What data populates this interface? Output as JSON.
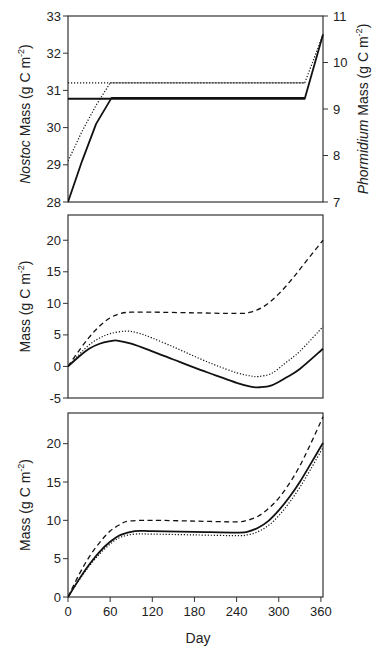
{
  "chart_data": [
    {
      "type": "line",
      "panel": "top",
      "title": "",
      "xlabel": "",
      "ylabel": "Nostoc Mass (g C m-2)",
      "ylabel_parts": {
        "italic": "Nostoc",
        "rest": " Mass (g C m",
        "sup": "-2",
        "close": ")"
      },
      "ylabel_right": "Phormidium Mass (g C m-2)",
      "ylabel_right_parts": {
        "italic": "Phormidium",
        "rest": " Mass (g C m",
        "sup": "-2",
        "close": ")"
      },
      "xlim": [
        0,
        363
      ],
      "ylim": [
        28,
        33
      ],
      "ylim_right": [
        7,
        11
      ],
      "yticks": [
        28,
        29,
        30,
        31,
        32,
        33
      ],
      "yticks_right": [
        7,
        8,
        9,
        10,
        11
      ],
      "grid": false,
      "series": [
        {
          "name": "Nostoc (solid)",
          "axis": "left",
          "style": "solid",
          "x": [
            0,
            20,
            40,
            62,
            337
          ],
          "y": [
            28.0,
            29.1,
            30.1,
            30.8,
            30.8
          ]
        },
        {
          "name": "Nostoc (dotted)",
          "axis": "left",
          "style": "dotted",
          "x": [
            0,
            20,
            40,
            60,
            337
          ],
          "y": [
            29.1,
            29.9,
            30.6,
            31.2,
            31.2
          ]
        },
        {
          "name": "Phormidium (solid)",
          "axis": "right",
          "style": "solid",
          "x": [
            0,
            337,
            363
          ],
          "y": [
            9.22,
            9.22,
            10.6
          ]
        },
        {
          "name": "Phormidium (dotted)",
          "axis": "right",
          "style": "dotted",
          "x": [
            0,
            337,
            363
          ],
          "y": [
            9.56,
            9.56,
            10.6
          ]
        }
      ]
    },
    {
      "type": "line",
      "panel": "middle",
      "title": "",
      "xlabel": "",
      "ylabel": "Mass (g C m-2)",
      "ylabel_parts": {
        "italic": "",
        "rest": "Mass (g C m",
        "sup": "-2",
        "close": ")"
      },
      "xlim": [
        0,
        363
      ],
      "ylim": [
        -5,
        24
      ],
      "yticks": [
        -5,
        0,
        5,
        10,
        15,
        20
      ],
      "grid": false,
      "series": [
        {
          "name": "solid",
          "style": "solid",
          "x": [
            0,
            15,
            30,
            45,
            60,
            70,
            90,
            120,
            150,
            180,
            210,
            240,
            260,
            273,
            290,
            310,
            330,
            363
          ],
          "y": [
            0,
            1.5,
            2.8,
            3.6,
            4.0,
            4.1,
            3.6,
            2.4,
            1.1,
            -0.2,
            -1.4,
            -2.6,
            -3.2,
            -3.3,
            -3.0,
            -1.8,
            -0.4,
            2.8
          ]
        },
        {
          "name": "dotted",
          "style": "dotted",
          "x": [
            0,
            15,
            30,
            45,
            60,
            82,
            100,
            120,
            150,
            180,
            210,
            240,
            260,
            271,
            290,
            310,
            330,
            363
          ],
          "y": [
            0,
            1.8,
            3.4,
            4.5,
            5.2,
            5.6,
            5.3,
            4.5,
            3.1,
            1.6,
            0.2,
            -1.0,
            -1.5,
            -1.6,
            -1.1,
            0.6,
            2.4,
            6.3
          ]
        },
        {
          "name": "dashed",
          "style": "dashed",
          "x": [
            0,
            15,
            30,
            45,
            60,
            75,
            90,
            120,
            180,
            240,
            260,
            280,
            300,
            320,
            340,
            363
          ],
          "y": [
            0,
            2.4,
            4.6,
            6.4,
            7.7,
            8.4,
            8.6,
            8.6,
            8.5,
            8.4,
            8.6,
            9.6,
            11.5,
            14.0,
            16.8,
            20.0
          ]
        }
      ]
    },
    {
      "type": "line",
      "panel": "bottom",
      "title": "",
      "xlabel": "Day",
      "ylabel": "Mass (g C m-2)",
      "ylabel_parts": {
        "italic": "",
        "rest": "Mass (g C m",
        "sup": "-2",
        "close": ")"
      },
      "xlim": [
        0,
        363
      ],
      "ylim": [
        0,
        24
      ],
      "xticks": [
        0,
        60,
        120,
        180,
        240,
        300,
        360
      ],
      "yticks": [
        0,
        5,
        10,
        15,
        20
      ],
      "grid": false,
      "series": [
        {
          "name": "solid",
          "style": "solid",
          "x": [
            0,
            15,
            30,
            45,
            60,
            75,
            95,
            120,
            180,
            240,
            255,
            270,
            285,
            300,
            315,
            330,
            345,
            363
          ],
          "y": [
            0,
            2.2,
            4.2,
            5.9,
            7.2,
            8.1,
            8.6,
            8.6,
            8.5,
            8.4,
            8.5,
            9.0,
            9.9,
            11.3,
            13.0,
            15.0,
            17.3,
            20.1
          ]
        },
        {
          "name": "dotted",
          "style": "dotted",
          "x": [
            0,
            15,
            30,
            45,
            60,
            75,
            95,
            120,
            180,
            240,
            255,
            270,
            285,
            300,
            315,
            330,
            345,
            363
          ],
          "y": [
            0,
            2.1,
            4.0,
            5.6,
            6.9,
            7.8,
            8.2,
            8.2,
            8.1,
            8.0,
            8.1,
            8.5,
            9.3,
            10.6,
            12.3,
            14.3,
            16.6,
            19.5
          ]
        },
        {
          "name": "dashed",
          "style": "dashed",
          "x": [
            0,
            15,
            30,
            45,
            60,
            75,
            86,
            120,
            180,
            240,
            255,
            270,
            285,
            300,
            315,
            330,
            345,
            363
          ],
          "y": [
            0,
            2.8,
            5.2,
            7.1,
            8.6,
            9.5,
            9.9,
            10.0,
            9.9,
            9.8,
            10.0,
            10.5,
            11.5,
            12.9,
            14.8,
            17.1,
            19.9,
            23.5
          ]
        }
      ]
    }
  ],
  "layout": {
    "plot_x0": 68,
    "plot_x1": 323,
    "panels": [
      {
        "top": 16,
        "bottom": 202
      },
      {
        "top": 215,
        "bottom": 398
      },
      {
        "top": 413,
        "bottom": 597
      }
    ],
    "colors": {
      "line": "#111111",
      "axis": "#333333",
      "text": "#222222"
    }
  },
  "labels": {
    "xlabel": "Day"
  }
}
